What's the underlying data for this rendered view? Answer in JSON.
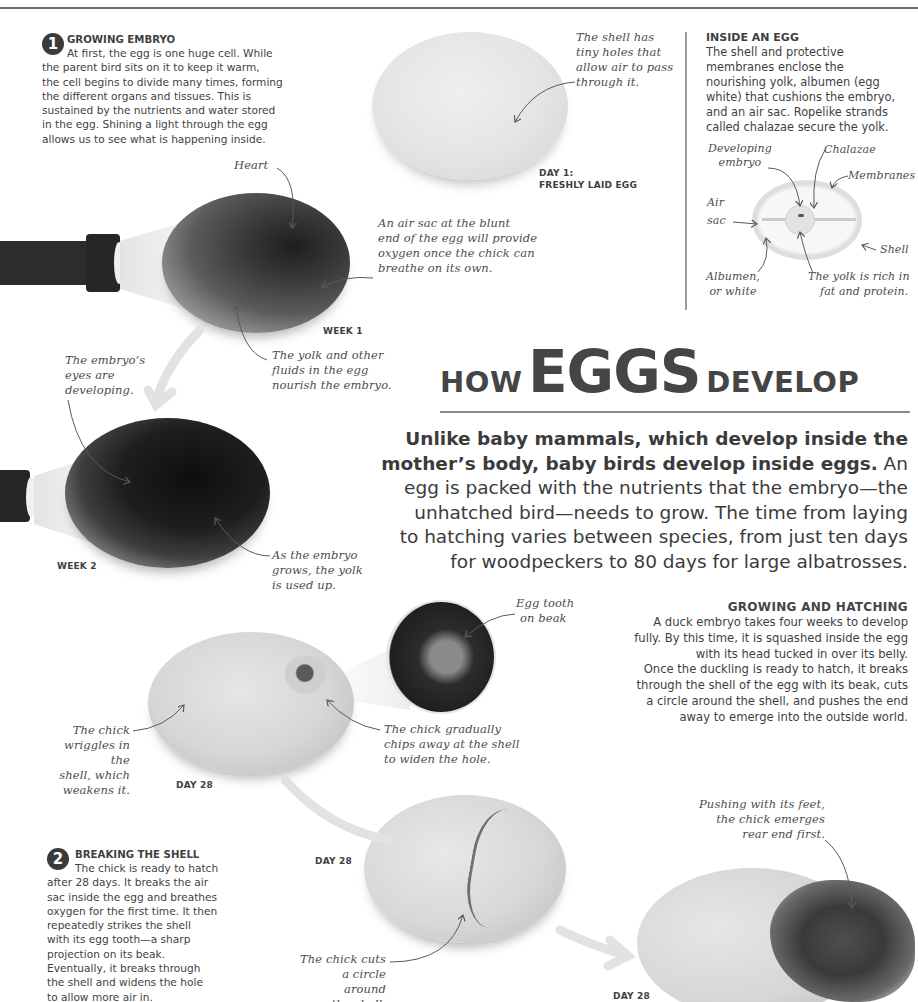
{
  "title": {
    "prefix": "HOW",
    "main": "EGGS",
    "suffix": "DEVELOP"
  },
  "intro": {
    "bold": "Unlike baby mammals, which develop inside the mother’s body, baby birds develop inside eggs.",
    "line1_bold": "Unlike baby mammals, which develop inside the",
    "line2_bold": "mother’s body, baby birds develop inside eggs.",
    "line2_rest": " An",
    "line3": "egg is packed with the nutrients that the embryo—the",
    "line4": "unhatched bird—needs to grow. The time from laying",
    "line5": "to hatching varies between species, from just ten days",
    "line6": "for woodpeckers to 80 days for large albatrosses."
  },
  "steps": [
    {
      "number": "1",
      "heading": "GROWING EMBRYO",
      "lines": [
        "At first, the egg is one huge cell. While",
        "the parent bird sits on it to keep it warm,",
        "the cell begins to divide many times, forming",
        "the different organs and tissues. This is",
        "sustained by the nutrients and water stored",
        "in the egg. Shining a light through the egg",
        "allows us to see what is happening inside."
      ]
    },
    {
      "number": "2",
      "heading": "BREAKING THE SHELL",
      "lines": [
        "The chick is ready to hatch",
        "after 28 days. It breaks the air",
        "sac inside the egg and breathes",
        "oxygen for the first time. It then",
        "repeatedly strikes the shell",
        "with its egg tooth—a sharp",
        "projection on its beak.",
        "Eventually, it breaks through",
        "the shell and widens the hole",
        "to allow more air in."
      ]
    }
  ],
  "sidebar": {
    "heading": "INSIDE AN EGG",
    "lines": [
      "The shell and protective",
      "membranes enclose the",
      "nourishing yolk, albumen (egg",
      "white) that cushions the embryo,",
      "and an air sac. Ropelike strands",
      "called chalazae secure the yolk."
    ],
    "diagram_labels": {
      "developing_embryo": [
        "Developing",
        "embryo"
      ],
      "chalazae": "Chalazae",
      "membranes": "Membranes",
      "air_sac": [
        "Air",
        "sac"
      ],
      "shell": "Shell",
      "albumen": [
        "Albumen,",
        "or white"
      ],
      "yolk": [
        "The yolk is rich in",
        "fat and protein."
      ]
    }
  },
  "hatching": {
    "heading": "GROWING AND HATCHING",
    "lines": [
      "A duck embryo takes four weeks to develop",
      "fully. By this time, it is squashed inside the egg",
      "with its head tucked in over its belly.",
      "Once the duckling is ready to hatch, it breaks",
      "through the shell of the egg with its beak, cuts",
      "a circle around the shell, and pushes the end",
      "away to emerge into the outside world."
    ]
  },
  "stage_labels": {
    "day1": [
      "DAY 1:",
      "FRESHLY LAID EGG"
    ],
    "week1": "WEEK 1",
    "week2": "WEEK 2",
    "day28_a": "DAY 28",
    "day28_b": "DAY 28",
    "day28_c": "DAY 28"
  },
  "annotations": {
    "shell_holes": [
      "The shell has",
      "tiny holes that",
      "allow air to pass",
      "through it."
    ],
    "heart": "Heart",
    "air_sac": [
      "An air sac at the blunt",
      "end of the egg will provide",
      "oxygen once the chick can",
      "breathe on its own."
    ],
    "yolk_fluids": [
      "The yolk and other",
      "fluids in the egg",
      "nourish the embryo."
    ],
    "eyes": [
      "The embryo’s",
      "eyes are",
      "developing."
    ],
    "yolk_used": [
      "As the embryo",
      "grows, the yolk",
      "is used up."
    ],
    "egg_tooth": [
      "Egg tooth",
      "on beak"
    ],
    "wriggles": [
      "The chick",
      "wriggles in the",
      "shell, which",
      "weakens it."
    ],
    "chips": [
      "The chick gradually",
      "chips away at the shell",
      "to widen the hole."
    ],
    "cuts_circle": [
      "The chick cuts",
      "a circle around",
      "the shell."
    ],
    "pushing": [
      "Pushing with its feet,",
      "the chick emerges",
      "rear end first."
    ]
  },
  "colors": {
    "text": "#3f3f3f",
    "rule": "#8a8a8a",
    "arrow": "#e2e2e2",
    "badge": "#3a3a3a"
  }
}
